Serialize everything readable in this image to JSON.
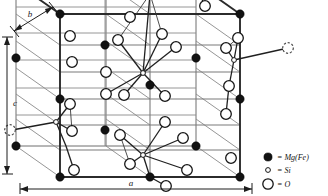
{
  "figure": {
    "kind": "crystal-structure-diagram",
    "background_color": "#ffffff",
    "line_color": "#2b2b2b"
  },
  "axes": [
    {
      "id": "a",
      "label": "a",
      "orientation": "horizontal-bottom",
      "label_x": 131,
      "label_y": 186
    },
    {
      "id": "b",
      "label": "b",
      "orientation": "diagonal-top-left",
      "label_x": 33,
      "label_y": 15
    },
    {
      "id": "c",
      "label": "c",
      "orientation": "vertical-left",
      "label_x": 9,
      "label_y": 103
    }
  ],
  "legend": {
    "items": [
      {
        "symbol": "filled-circle",
        "radius": 4.1,
        "label": "= Mg(Fe)",
        "color": "#121212",
        "cx": 268,
        "cy": 157,
        "text_x": 277,
        "text_y": 160
      },
      {
        "symbol": "small-open-circle",
        "radius": 2.3,
        "label": "= Si",
        "color": "#ffffff",
        "cx": 268,
        "cy": 170,
        "text_x": 277,
        "text_y": 173
      },
      {
        "symbol": "large-open-circle",
        "radius": 5.2,
        "label": "= O",
        "color": "#ffffff",
        "cx": 268,
        "cy": 184,
        "text_x": 277,
        "text_y": 187
      }
    ]
  },
  "cell": {
    "front_face": [
      [
        60,
        177
      ],
      [
        240,
        177
      ],
      [
        240,
        14
      ],
      [
        60,
        14
      ]
    ],
    "back_face": [
      [
        16,
        146
      ],
      [
        196,
        146
      ],
      [
        196,
        -16
      ],
      [
        16,
        -16
      ]
    ],
    "depth_vector": [
      -44,
      -31
    ],
    "front_edges": [
      [
        [
          60,
          177
        ],
        [
          240,
          177
        ]
      ],
      [
        [
          240,
          177
        ],
        [
          240,
          14
        ]
      ],
      [
        [
          60,
          14
        ],
        [
          240,
          14
        ]
      ],
      [
        [
          60,
          14
        ],
        [
          60,
          177
        ]
      ]
    ],
    "back_edges": [
      [
        [
          16,
          146
        ],
        [
          196,
          146
        ]
      ],
      [
        [
          16,
          -14
        ],
        [
          196,
          -14
        ]
      ],
      [
        [
          16,
          -14
        ],
        [
          16,
          146
        ]
      ],
      [
        [
          196,
          -14
        ],
        [
          196,
          146
        ]
      ]
    ],
    "connector_edges": [
      [
        [
          60,
          177
        ],
        [
          16,
          146
        ]
      ],
      [
        [
          240,
          177
        ],
        [
          196,
          146
        ]
      ],
      [
        [
          60,
          14
        ],
        [
          16,
          -14
        ]
      ],
      [
        [
          240,
          14
        ],
        [
          196,
          -14
        ]
      ]
    ]
  },
  "grid": {
    "horizontal_front_y": [
      14,
      45,
      72,
      99,
      125,
      150,
      177
    ],
    "vertical_front_x": [
      60,
      150,
      240
    ],
    "mid_plane_x": 150
  },
  "atoms": {
    "mg_fe": [
      [
        60,
        177
      ],
      [
        240,
        177
      ],
      [
        60,
        14
      ],
      [
        240,
        14
      ],
      [
        60,
        99
      ],
      [
        240,
        99
      ],
      [
        150,
        -6
      ],
      [
        150,
        85
      ],
      [
        150,
        177
      ],
      [
        196,
        146
      ],
      [
        196,
        58
      ],
      [
        16,
        146
      ],
      [
        16,
        58
      ],
      [
        105,
        45
      ],
      [
        105,
        130
      ],
      [
        196,
        -14
      ]
    ],
    "si": [
      [
        143,
        73
      ],
      [
        143,
        155
      ],
      [
        56,
        122
      ],
      [
        234,
        60
      ]
    ],
    "o": [
      [
        70,
        36
      ],
      [
        70,
        64
      ],
      [
        72,
        104
      ],
      [
        72,
        131
      ],
      [
        74,
        170
      ],
      [
        130,
        18
      ],
      [
        132,
        72
      ],
      [
        124,
        95
      ],
      [
        120,
        135
      ],
      [
        130,
        157
      ],
      [
        165,
        96
      ],
      [
        160,
        122
      ],
      [
        162,
        34
      ],
      [
        176,
        47
      ],
      [
        183,
        138
      ],
      [
        187,
        163
      ],
      [
        238,
        36
      ],
      [
        233,
        86
      ],
      [
        226,
        114
      ],
      [
        229,
        160
      ],
      [
        106,
        72
      ],
      [
        108,
        94
      ]
    ],
    "o_dashed": [
      [
        10,
        130
      ],
      [
        290,
        48
      ]
    ]
  },
  "tetrahedra": [
    {
      "si": [
        143,
        73
      ],
      "bonds": [
        [
          143,
          73
        ],
        [
          120,
          40
        ]
      ],
      "oxygens": [
        [
          132,
          72
        ],
        [
          124,
          95
        ],
        [
          165,
          96
        ],
        [
          150,
          -6
        ]
      ]
    },
    {
      "si": [
        143,
        155
      ],
      "bonds": [],
      "oxygens": [
        [
          120,
          135
        ],
        [
          130,
          157
        ],
        [
          183,
          138
        ],
        [
          150,
          177
        ]
      ]
    },
    {
      "si": [
        56,
        122
      ],
      "bonds": [],
      "oxygens": [
        [
          70,
          104
        ],
        [
          72,
          131
        ],
        [
          10,
          130
        ],
        [
          105,
          130
        ]
      ]
    },
    {
      "si": [
        234,
        60
      ],
      "bonds": [],
      "oxygens": [
        [
          226,
          48
        ],
        [
          238,
          36
        ],
        [
          290,
          48
        ],
        [
          229,
          86
        ]
      ]
    }
  ]
}
